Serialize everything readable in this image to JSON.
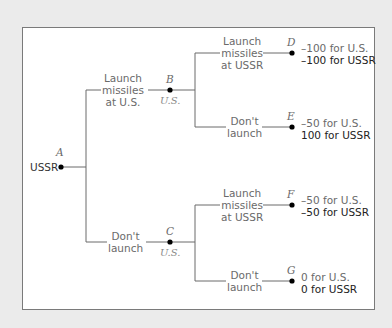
{
  "colors": {
    "background": "#ebebeb",
    "box": "#ffffff",
    "line": "#6a6a6a",
    "node": "#000000",
    "us_payoff": "#6a6a6a",
    "ussr_payoff": "#222222"
  },
  "root": {
    "player": "USSR",
    "node": "A"
  },
  "nodes": {
    "A": {
      "letter": "A",
      "player": "USSR"
    },
    "B": {
      "letter": "B",
      "player": "U.S."
    },
    "C": {
      "letter": "C",
      "player": "U.S."
    },
    "D": {
      "letter": "D"
    },
    "E": {
      "letter": "E"
    },
    "F": {
      "letter": "F"
    },
    "G": {
      "letter": "G"
    }
  },
  "branches": {
    "A_B": "Launch\nmissiles\nat U.S.",
    "A_C": "Don't\nlaunch",
    "B_D": "Launch\nmissiles\nat USSR",
    "B_E": "Don't\nlaunch",
    "C_F": "Launch\nmissiles\nat USSR",
    "C_G": "Don't\nlaunch"
  },
  "payoffs": {
    "D": {
      "us": "–100 for U.S.",
      "ussr": "–100 for USSR"
    },
    "E": {
      "us": "–50 for U.S.",
      "ussr": "100 for USSR"
    },
    "F": {
      "us": "–50 for U.S.",
      "ussr": "–50 for USSR"
    },
    "G": {
      "us": "0 for U.S.",
      "ussr": "0 for USSR"
    }
  }
}
